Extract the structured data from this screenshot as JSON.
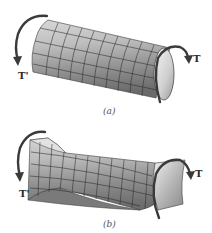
{
  "figures": [
    {
      "id": "a",
      "caption": "(a)",
      "description": "Undeformed circular shaft with surface grid subjected to end torques",
      "torque_left_label": "T'",
      "torque_right_label": "T"
    },
    {
      "id": "b",
      "caption": "(b)",
      "description": "Twisted shaft showing distorted grid under torsion",
      "torque_left_label": "T'",
      "torque_right_label": "T"
    }
  ],
  "colors": {
    "shaft_light": "#e6e6e6",
    "shaft_mid": "#a9a9a9",
    "shaft_dark": "#6e6e6e",
    "grid": "#2b2b2b",
    "arrow": "#3a3a3a",
    "background": "#ffffff"
  }
}
